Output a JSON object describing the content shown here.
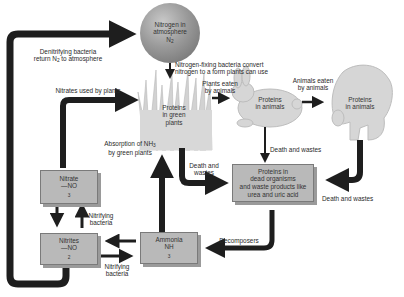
{
  "colors": {
    "arrow": "#1e1e1e",
    "box_fill": "#b9b9b9",
    "box_shadow": "#9a9a9a",
    "organism_fill": "#d6d6d6",
    "sphere_dark": "#6a6a6a",
    "sphere_light": "#c9c9c9"
  },
  "nodes": {
    "atmosphere": {
      "line1": "Nitrogen in",
      "line2": "atmosphere",
      "formula": "N",
      "formula_sub": "2"
    },
    "plants": {
      "line1": "Proteins",
      "line2": "in green",
      "line3": "plants"
    },
    "herbivore": {
      "line1": "Proteins",
      "line2": "in animals",
      "icon": "rabbit-icon"
    },
    "carnivore": {
      "line1": "Proteins",
      "line2": "in animals",
      "icon": "bear-icon"
    },
    "dead_matter": {
      "line1": "Proteins in",
      "line2": "dead organisms",
      "line3": "and waste products like",
      "line4": "urea and uric acid"
    },
    "nitrate": {
      "line1": "Nitrate",
      "formula": "—NO",
      "formula_sub": "3"
    },
    "nitrites": {
      "line1": "Nitrites",
      "formula": "—NO",
      "formula_sub": "2"
    },
    "ammonia": {
      "line1": "Ammonia",
      "formula": "NH",
      "formula_sub": "3"
    }
  },
  "edges": {
    "denitrifying": {
      "line1": "Denitrifying bacteria",
      "line2_pre": "return N",
      "line2_sub": "2",
      "line2_post": " to atmosphere"
    },
    "fixing": {
      "line1": "Nitrogen-fixing bacteria convert",
      "line2": "nitrogen to a form plants can use"
    },
    "plants_eaten": {
      "line1": "Plants eaten",
      "line2": "by animals"
    },
    "animals_eaten": {
      "line1": "Animals eaten",
      "line2": "by animals"
    },
    "nitrates_used": {
      "text": "Nitrates used by plants"
    },
    "absorption": {
      "line1_pre": "Absorption of NH",
      "line1_sub": "3",
      "line2": "by green plants"
    },
    "death_wastes_plants": {
      "line1": "Death and",
      "line2": "wastes"
    },
    "death_wastes_herbivore": {
      "text": "Death and wastes"
    },
    "death_wastes_carnivore": {
      "text": "Death and wastes"
    },
    "nitrifying_up": {
      "line1": "Nitrifying",
      "line2": "bacteria"
    },
    "nitrifying_right": {
      "line1": "Nitrifying",
      "line2": "bacteria"
    },
    "decomposers": {
      "text": "Decomposers"
    }
  }
}
